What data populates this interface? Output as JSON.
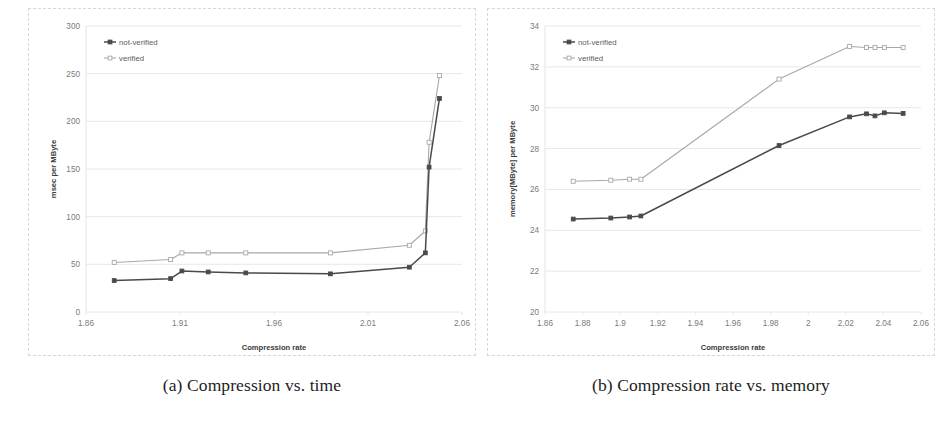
{
  "figure": {
    "panels": [
      {
        "id": "panel-a",
        "caption": "(a) Compression vs. time"
      },
      {
        "id": "panel-b",
        "caption": "(b) Compression rate vs. memory"
      }
    ]
  },
  "colors": {
    "not_verified": "#4a4a4a",
    "verified": "#a8a8a8",
    "gridline": "#e2e2e2",
    "frame": "#d7d7d7",
    "tick_text": "#7a7a7a",
    "axis_title_text": "#3b3b3b",
    "caption_text": "#1d1d1d",
    "background": "#ffffff"
  },
  "chart_data": [
    {
      "type": "line",
      "title": "",
      "panel_label": "(a) Compression vs. time",
      "xlabel": "Compression rate",
      "ylabel": "msec per MByte",
      "xlim": [
        1.86,
        2.06
      ],
      "ylim": [
        0,
        300
      ],
      "xticks": [
        "1.86",
        "1.91",
        "1.96",
        "2.01",
        "2.06"
      ],
      "xtick_values": [
        1.86,
        1.91,
        1.96,
        2.01,
        2.06
      ],
      "yticks": [
        "0",
        "50",
        "100",
        "150",
        "200",
        "250",
        "300"
      ],
      "ytick_values": [
        0,
        50,
        100,
        150,
        200,
        250,
        300
      ],
      "grid": true,
      "legend_position": "top-left",
      "series": [
        {
          "name": "not-verified",
          "color": "#4a4a4a",
          "marker": "square",
          "x": [
            1.875,
            1.905,
            1.911,
            1.925,
            1.945,
            1.99,
            2.032,
            2.0405,
            2.0425,
            2.048
          ],
          "y": [
            33,
            35,
            43,
            42,
            41,
            40,
            47,
            62,
            152,
            224
          ]
        },
        {
          "name": "verified",
          "color": "#a8a8a8",
          "marker": "square",
          "x": [
            1.875,
            1.905,
            1.911,
            1.925,
            1.945,
            1.99,
            2.032,
            2.0405,
            2.0425,
            2.048
          ],
          "y": [
            52,
            55,
            62,
            62,
            62,
            62,
            70,
            85,
            178,
            248
          ]
        }
      ]
    },
    {
      "type": "line",
      "title": "",
      "panel_label": "(b) Compression rate vs. memory",
      "xlabel": "Compression rate",
      "ylabel": "memory[MByte] per MByte",
      "xlim": [
        1.86,
        2.06
      ],
      "ylim": [
        20,
        34
      ],
      "xticks": [
        "1.86",
        "1.88",
        "1.9",
        "1.92",
        "1.94",
        "1.96",
        "1.98",
        "2",
        "2.02",
        "2.04",
        "2.06"
      ],
      "xtick_values": [
        1.86,
        1.88,
        1.9,
        1.92,
        1.94,
        1.96,
        1.98,
        2.0,
        2.02,
        2.04,
        2.06
      ],
      "yticks": [
        "20",
        "22",
        "24",
        "26",
        "28",
        "30",
        "32",
        "34"
      ],
      "ytick_values": [
        20,
        22,
        24,
        26,
        28,
        30,
        32,
        34
      ],
      "grid": true,
      "legend_position": "top-left",
      "series": [
        {
          "name": "not-verified",
          "color": "#4a4a4a",
          "marker": "square",
          "x": [
            1.875,
            1.895,
            1.905,
            1.911,
            1.9845,
            2.022,
            2.031,
            2.0355,
            2.0405,
            2.0505
          ],
          "y": [
            24.55,
            24.6,
            24.65,
            24.7,
            28.15,
            29.55,
            29.7,
            29.6,
            29.75,
            29.72
          ]
        },
        {
          "name": "verified",
          "color": "#a8a8a8",
          "marker": "square",
          "x": [
            1.875,
            1.895,
            1.905,
            1.911,
            1.9845,
            2.022,
            2.031,
            2.0355,
            2.0405,
            2.0505
          ],
          "y": [
            26.4,
            26.45,
            26.5,
            26.5,
            31.4,
            33.0,
            32.95,
            32.95,
            32.95,
            32.95
          ]
        }
      ]
    }
  ]
}
